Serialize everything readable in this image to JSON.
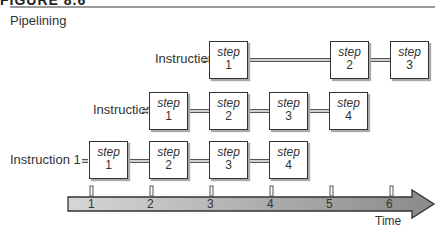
{
  "figure": {
    "label": "FIGURE 8.6",
    "title": "Pipelining"
  },
  "instructions": [
    {
      "label": "Instruction 3",
      "steps": [
        {
          "word": "step",
          "num": "1"
        },
        {
          "word": "step",
          "num": "2"
        },
        {
          "word": "step",
          "num": "3"
        }
      ]
    },
    {
      "label": "Instruction 2",
      "steps": [
        {
          "word": "step",
          "num": "1"
        },
        {
          "word": "step",
          "num": "2"
        },
        {
          "word": "step",
          "num": "3"
        },
        {
          "word": "step",
          "num": "4"
        }
      ]
    },
    {
      "label": "Instruction 1",
      "steps": [
        {
          "word": "step",
          "num": "1"
        },
        {
          "word": "step",
          "num": "2"
        },
        {
          "word": "step",
          "num": "3"
        },
        {
          "word": "step",
          "num": "4"
        }
      ]
    }
  ],
  "timeline": {
    "ticks": [
      "1",
      "2",
      "3",
      "4",
      "5",
      "6"
    ],
    "label": "Time"
  }
}
